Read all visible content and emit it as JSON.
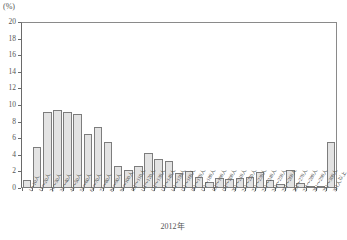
{
  "chart_data": {
    "type": "bar",
    "title": "",
    "subtitle": "",
    "unit_label": "(%)",
    "xlabel": "2012年",
    "ylabel": "",
    "ylim": [
      0,
      20
    ],
    "ytick_step": 2,
    "yticks": [
      "0",
      "2",
      "4",
      "6",
      "8",
      "10",
      "12",
      "14",
      "16",
      "18",
      "20"
    ],
    "grid": false,
    "legend": null,
    "categories": [
      "1〜10人",
      "11〜20人",
      "21〜30人",
      "31〜40人",
      "41〜50人",
      "51〜60人",
      "61〜70人",
      "71〜80人",
      "81〜90人",
      "91〜100人",
      "101〜110人",
      "111〜120人",
      "121〜130人",
      "131〜140人",
      "141〜150人",
      "151〜160人",
      "161〜170人",
      "171〜180人",
      "181〜190人",
      "191〜200人",
      "201〜210人",
      "211〜220人",
      "221〜230人",
      "231〜240人",
      "241〜250人",
      "251〜260人",
      "261〜270人",
      "271〜280人",
      "281〜290人",
      "291〜300人",
      "301人以上"
    ],
    "values": [
      1.0,
      5.0,
      9.1,
      9.4,
      9.1,
      8.9,
      6.5,
      7.3,
      5.6,
      2.6,
      2.2,
      2.6,
      4.2,
      3.5,
      3.2,
      1.8,
      2.0,
      1.3,
      0.7,
      1.2,
      1.1,
      1.2,
      1.3,
      1.9,
      1.0,
      0.5,
      2.2,
      0.6,
      0.2,
      0.15,
      5.5
    ]
  }
}
